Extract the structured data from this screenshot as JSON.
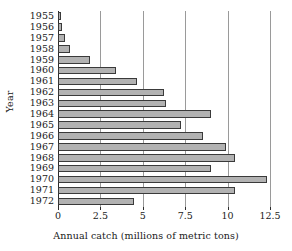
{
  "chart_data": {
    "type": "bar",
    "orientation": "horizontal",
    "title": "",
    "xlabel": "Annual catch (millions of metric tons)",
    "ylabel": "Year",
    "xlim": [
      0,
      12.5
    ],
    "xticks": [
      0,
      2.5,
      5,
      7.5,
      10,
      12.5
    ],
    "xtick_labels": [
      "0",
      "2.5",
      "5",
      "7.5",
      "10",
      "12.5"
    ],
    "grid": "vertical",
    "legend": "none",
    "bar_color": "#b2b2b2",
    "bar_edge_color": "#3a3a3a",
    "categories": [
      "1955",
      "1956",
      "1957",
      "1958",
      "1959",
      "1960",
      "1961",
      "1962",
      "1963",
      "1964",
      "1965",
      "1966",
      "1967",
      "1968",
      "1969",
      "1970",
      "1971",
      "1972"
    ],
    "values": [
      0.2,
      0.25,
      0.4,
      0.7,
      1.9,
      3.4,
      4.65,
      6.25,
      6.35,
      9.0,
      7.25,
      8.55,
      9.9,
      10.45,
      9.05,
      12.3,
      10.45,
      4.5
    ]
  }
}
